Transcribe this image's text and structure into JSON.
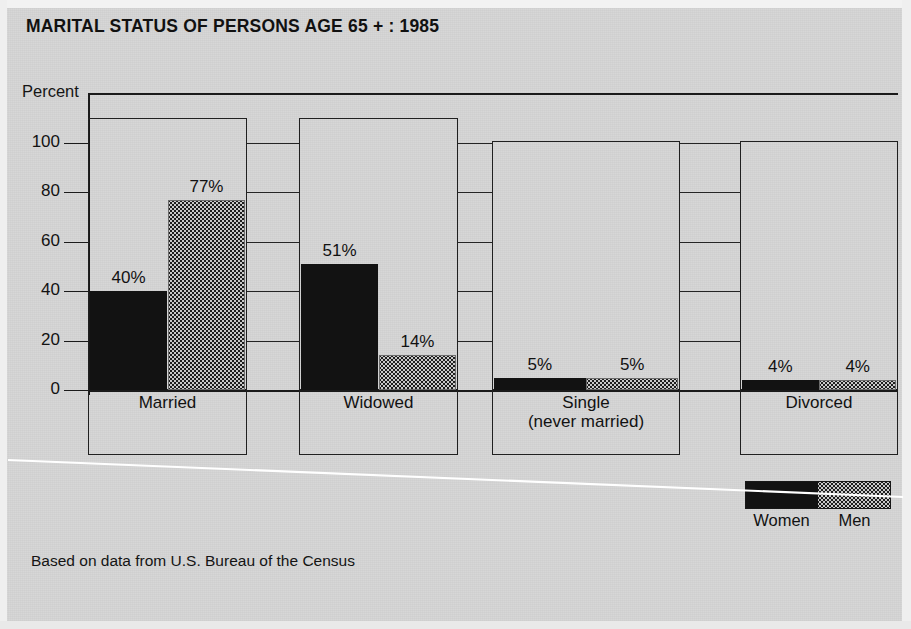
{
  "title": "MARITAL STATUS OF PERSONS AGE 65 + : 1985",
  "source_note": "Based on data from U.S. Bureau of the Census",
  "axis": {
    "y_title": "Percent",
    "ticks": [
      "0",
      "20",
      "40",
      "60",
      "80",
      "100"
    ]
  },
  "legend": {
    "women_label": "Women",
    "men_label": "Men"
  },
  "colors": {
    "background": "#d6d6d6",
    "women": "#121212",
    "men": "#c9c9c9",
    "ink": "#1a1a1a"
  },
  "categories": [
    {
      "label": "Married",
      "women_value": "40%",
      "men_value": "77%"
    },
    {
      "label": "Widowed",
      "women_value": "51%",
      "men_value": "14%"
    },
    {
      "label": "Single\n(never married)",
      "women_value": "5%",
      "men_value": "5%"
    },
    {
      "label": "Divorced",
      "women_value": "4%",
      "men_value": "4%"
    }
  ],
  "chart_data": {
    "type": "bar",
    "title": "MARITAL STATUS OF PERSONS AGE 65 + : 1985",
    "xlabel": "",
    "ylabel": "Percent",
    "ylim": [
      0,
      110
    ],
    "yticks": [
      0,
      20,
      40,
      60,
      80,
      100
    ],
    "grid": true,
    "legend_position": "bottom-right",
    "categories": [
      "Married",
      "Widowed",
      "Single (never married)",
      "Divorced"
    ],
    "series": [
      {
        "name": "Women",
        "values": [
          40,
          51,
          5,
          4
        ],
        "pattern": "solid-black"
      },
      {
        "name": "Men",
        "values": [
          77,
          14,
          5,
          4
        ],
        "pattern": "dotted-gray"
      }
    ],
    "data_labels": [
      [
        "40%",
        "77%"
      ],
      [
        "51%",
        "14%"
      ],
      [
        "5%",
        "5%"
      ],
      [
        "4%",
        "4%"
      ]
    ],
    "annotations": [
      "Based on data from U.S. Bureau of the Census"
    ]
  }
}
